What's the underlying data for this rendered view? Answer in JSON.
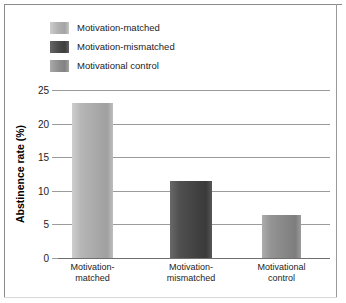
{
  "chart_data": {
    "type": "bar",
    "title": "",
    "xlabel": "",
    "ylabel": "Abstinence rate (%)",
    "ylim": [
      0,
      25
    ],
    "yticks": [
      0,
      5,
      10,
      15,
      20,
      25
    ],
    "ytick_labels": [
      "0",
      "5",
      "10",
      "15",
      "20",
      "25"
    ],
    "grid": true,
    "legend_position": "top-left",
    "categories": [
      "Motivation-\nmatched",
      "Motivation-\nmismatched",
      "Motivational\ncontrol"
    ],
    "category_lines": [
      [
        "Motivation-",
        "matched"
      ],
      [
        "Motivation-",
        "mismatched"
      ],
      [
        "Motivational",
        "control"
      ]
    ],
    "values": [
      23.1,
      11.4,
      6.4
    ],
    "series": [
      {
        "name": "Abstinence rate (%)",
        "values": [
          23.1,
          11.4,
          6.4
        ]
      }
    ],
    "bar_colors": [
      "#b0b0b0",
      "#4a4a4a",
      "#8e8e8e"
    ]
  },
  "legend": {
    "items": [
      {
        "label": "Motivation-matched",
        "color": "#b0b0b0"
      },
      {
        "label": "Motivation-mismatched",
        "color": "#4a4a4a"
      },
      {
        "label": "Motivational control",
        "color": "#8e8e8e"
      }
    ]
  },
  "axes": {
    "y_title": "Abstinence rate (%)"
  }
}
